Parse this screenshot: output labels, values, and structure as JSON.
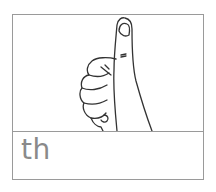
{
  "card": {
    "image": {
      "icon": "thumbs-up-hand-icon",
      "description": "line drawing of a hand giving thumbs up"
    },
    "label": "th"
  },
  "colors": {
    "border": "#9a9a9a",
    "label": "#8a8a8a",
    "line": "#333333"
  }
}
